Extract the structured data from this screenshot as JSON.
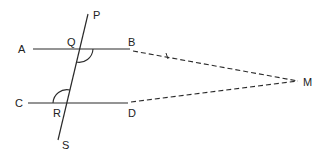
{
  "diagram": {
    "type": "geometry",
    "colors": {
      "stroke": "#2a2a2a",
      "background": "#ffffff"
    },
    "points": {
      "A": {
        "label": "A"
      },
      "B": {
        "label": "B"
      },
      "C": {
        "label": "C"
      },
      "D": {
        "label": "D"
      },
      "P": {
        "label": "P"
      },
      "Q": {
        "label": "Q"
      },
      "R": {
        "label": "R"
      },
      "S": {
        "label": "S"
      },
      "M": {
        "label": "M"
      }
    },
    "lines": [
      {
        "from": "A",
        "to": "B",
        "style": "solid"
      },
      {
        "from": "C",
        "to": "D",
        "style": "solid"
      },
      {
        "from": "P",
        "to": "S",
        "style": "solid"
      },
      {
        "from": "B",
        "to": "M",
        "style": "dashed",
        "tick": true
      },
      {
        "from": "D",
        "to": "M",
        "style": "dashed"
      }
    ],
    "angle_marks": [
      {
        "vertex": "Q",
        "between": [
          "B",
          "S"
        ]
      },
      {
        "vertex": "R",
        "between": [
          "C",
          "P"
        ]
      }
    ]
  }
}
